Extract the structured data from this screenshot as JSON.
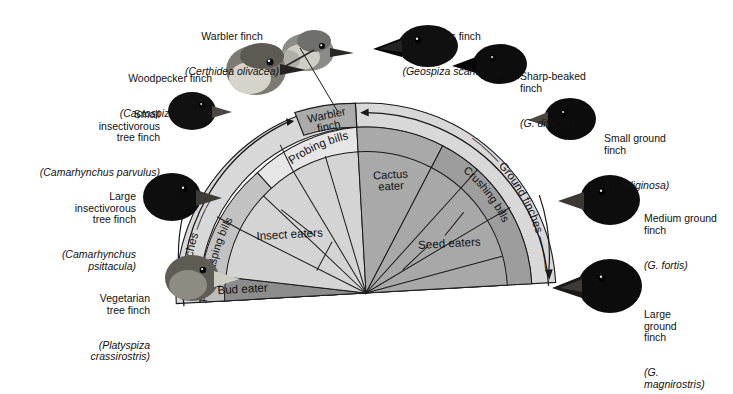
{
  "figure": {
    "type": "diagram"
  },
  "species_labels": [
    {
      "id": "warbler-finch",
      "common": "Warbler finch",
      "scientific": "(Certhidea olivacea)",
      "align": "center",
      "x": 232,
      "y": 10
    },
    {
      "id": "cactus-finch",
      "common": "Cactus finch",
      "scientific": "(Geospiza scandens)",
      "align": "center",
      "x": 452,
      "y": 10
    },
    {
      "id": "woodpecker-finch",
      "common": "Woodpecker finch",
      "scientific": "(Cactospiza pallida)",
      "align": "right",
      "x": 110,
      "y": 52
    },
    {
      "id": "sharp-beaked-finch",
      "common": "Sharp-beaked\nfinch",
      "scientific": "(G. difficilis)",
      "align": "left",
      "x": 520,
      "y": 52
    },
    {
      "id": "small-insectivorous-tree-finch",
      "common": "Small\ninsectivorous\ntree finch",
      "scientific": "(Camarhynchus parvulus)",
      "align": "right",
      "x": 125,
      "y": 89
    },
    {
      "id": "small-ground-finch",
      "common": "Small ground\nfinch",
      "scientific": "(G. fuliginosa)",
      "align": "left",
      "x": 610,
      "y": 110
    },
    {
      "id": "large-insectivorous-tree-finch",
      "common": "Large\ninsectivorous\ntree finch",
      "scientific": "(Camarhynchus\npsittacula)",
      "align": "right",
      "x": 102,
      "y": 170
    },
    {
      "id": "medium-ground-finch",
      "common": "Medium ground\nfinch",
      "scientific": "(G. fortis)",
      "align": "left",
      "x": 640,
      "y": 192
    },
    {
      "id": "vegetarian-tree-finch",
      "common": "Vegetarian\ntree finch",
      "scientific": "(Platyspiza\ncrassirostris)",
      "align": "right",
      "x": 95,
      "y": 272
    },
    {
      "id": "large-ground-finch",
      "common": "Large\nground\nfinch",
      "scientific": "(G.\nmagnirostris)",
      "align": "left",
      "x": 640,
      "y": 285
    }
  ],
  "fan": {
    "center_label_warbler": "Warbler\nfinch",
    "outer_ring": [
      {
        "id": "tree-finches",
        "label": "Tree finches"
      },
      {
        "id": "ground-finches",
        "label": "Ground finches"
      }
    ],
    "middle_ring": [
      {
        "id": "parrot-like-bill",
        "label": "Parrot-like\nbill"
      },
      {
        "id": "grasping-bills",
        "label": "Grasping bills"
      },
      {
        "id": "probing-bills",
        "label": "Probing bills"
      },
      {
        "id": "crushing-bills",
        "label": "Crushing bills"
      }
    ],
    "inner_wedges": [
      {
        "id": "bud-eater",
        "label": "Bud eater"
      },
      {
        "id": "insect-eaters",
        "label": "Insect eaters"
      },
      {
        "id": "cactus-eater",
        "label": "Cactus\neater"
      },
      {
        "id": "seed-eaters",
        "label": "Seed eaters"
      }
    ],
    "colors": {
      "outer_ring_fill": "#d7d7d7",
      "warbler_box_fill": "#a8a8a8",
      "middle_left_fill": "#bfbfbf",
      "middle_probing_fill": "#e4e4e4",
      "middle_right_fill": "#9a9a9a",
      "inner_left_fill": "#d2d2d2",
      "inner_right_fill": "#a6a6a6",
      "bud_eater_fill": "#8a8a8a",
      "cactus_eater_fill": "#a6a6a6",
      "stroke": "#1a1a1a"
    }
  }
}
